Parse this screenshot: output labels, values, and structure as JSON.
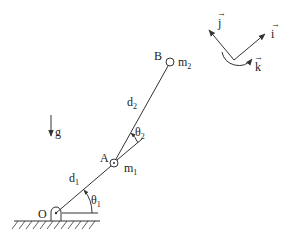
{
  "diagram": {
    "type": "double-pendulum-robot-arm",
    "points": {
      "O": {
        "label": "O"
      },
      "A": {
        "label": "A",
        "mass": "m",
        "mass_sub": "1"
      },
      "B": {
        "label": "B",
        "mass": "m",
        "mass_sub": "2"
      }
    },
    "links": [
      {
        "name": "d",
        "sub": "1"
      },
      {
        "name": "d",
        "sub": "2"
      }
    ],
    "angles": [
      {
        "name": "θ",
        "sub": "1"
      },
      {
        "name": "θ",
        "sub": "2"
      }
    ],
    "gravity": {
      "label": "g"
    },
    "frame": {
      "i": "i",
      "j": "j",
      "k": "k"
    }
  }
}
